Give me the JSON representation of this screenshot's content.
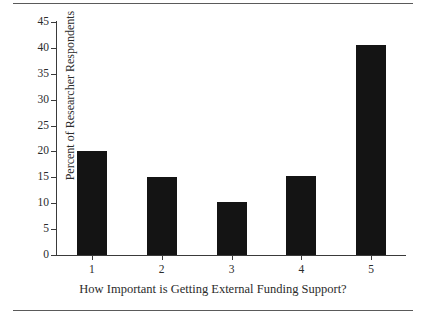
{
  "chart_data": {
    "type": "bar",
    "title": "",
    "xlabel": "How Important is Getting External Funding Support?",
    "ylabel": "Percent of Researcher Respondents",
    "categories": [
      "1",
      "2",
      "3",
      "4",
      "5"
    ],
    "values": [
      20.0,
      15.1,
      10.2,
      15.3,
      40.5
    ],
    "ylim": [
      0,
      45
    ],
    "yticks": [
      0,
      5,
      10,
      15,
      20,
      25,
      30,
      35,
      40,
      45
    ],
    "ytick_labels": [
      "0",
      "5",
      "10",
      "15",
      "20",
      "25",
      "30",
      "35",
      "40",
      "45"
    ],
    "xtick_labels": [
      "1",
      "2",
      "3",
      "4",
      "5"
    ],
    "grid": false,
    "legend": null,
    "bar_color": "#141414",
    "axis_color": "#3a3a3a",
    "text_color": "#2b2b2b",
    "background": "#ffffff"
  },
  "frame": {
    "rule_color": "#5a5a5a",
    "top_rule": "",
    "bottom_rule": ""
  }
}
